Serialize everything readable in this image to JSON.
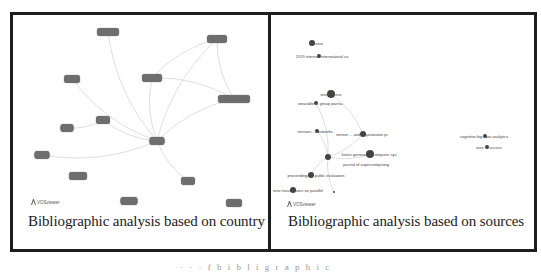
{
  "figure": {
    "panels": [
      {
        "caption": "Bibliographic analysis based on country",
        "watermark": "VOSviewer",
        "nodes": [
          {
            "x": 108,
            "y": 32,
            "w": 22,
            "label": "country"
          },
          {
            "x": 217,
            "y": 39,
            "w": 20,
            "label": "country"
          },
          {
            "x": 72,
            "y": 79,
            "w": 16,
            "label": "country"
          },
          {
            "x": 152,
            "y": 78,
            "w": 20,
            "label": "country"
          },
          {
            "x": 234,
            "y": 99,
            "w": 32,
            "label": "country"
          },
          {
            "x": 103,
            "y": 120,
            "w": 14,
            "label": "country"
          },
          {
            "x": 67,
            "y": 128,
            "w": 13,
            "label": "country"
          },
          {
            "x": 157,
            "y": 141,
            "w": 15,
            "label": "country"
          },
          {
            "x": 42,
            "y": 155,
            "w": 15,
            "label": "country"
          },
          {
            "x": 78,
            "y": 176,
            "w": 18,
            "label": "country"
          },
          {
            "x": 188,
            "y": 181,
            "w": 14,
            "label": "country"
          },
          {
            "x": 129,
            "y": 201,
            "w": 17,
            "label": "country"
          },
          {
            "x": 234,
            "y": 203,
            "w": 16,
            "label": "country"
          }
        ],
        "edges": [
          [
            0,
            7
          ],
          [
            1,
            3
          ],
          [
            1,
            7
          ],
          [
            4,
            7
          ],
          [
            3,
            7
          ],
          [
            5,
            7
          ],
          [
            6,
            5
          ],
          [
            8,
            7
          ],
          [
            7,
            10
          ],
          [
            2,
            7
          ],
          [
            1,
            4
          ],
          [
            4,
            3
          ]
        ]
      },
      {
        "caption": "Bibliographic analysis based on sources",
        "watermark": "VOSviewer",
        "sources": [
          {
            "x": 316,
            "y": 43,
            "label": "sensors"
          },
          {
            "x": 322,
            "y": 56,
            "label": "2019 internati international co"
          },
          {
            "x": 331,
            "y": 94,
            "label": "ieee access"
          },
          {
            "x": 320,
            "y": 103,
            "label": "wearable ... group journa"
          },
          {
            "x": 315,
            "y": 131,
            "label": "sensors ... networks"
          },
          {
            "x": 362,
            "y": 134,
            "label": "sensor ... and organization pr"
          },
          {
            "x": 369,
            "y": 154,
            "label": "future generation computer sys"
          },
          {
            "x": 366,
            "y": 164,
            "label": "journal of supercomputing"
          },
          {
            "x": 316,
            "y": 175,
            "label": "proceedings ... public evaluation"
          },
          {
            "x": 298,
            "y": 190,
            "label": "ieee transactions on parallel"
          },
          {
            "x": 484,
            "y": 136,
            "label": "cognitive big data analytics"
          },
          {
            "x": 489,
            "y": 147,
            "label": "ieee ... access"
          }
        ],
        "dots": [
          {
            "x": 312,
            "y": 43,
            "r": 3
          },
          {
            "x": 319,
            "y": 56,
            "r": 2
          },
          {
            "x": 331,
            "y": 94,
            "r": 4
          },
          {
            "x": 316,
            "y": 103,
            "r": 2
          },
          {
            "x": 317,
            "y": 131,
            "r": 2
          },
          {
            "x": 363,
            "y": 134,
            "r": 3
          },
          {
            "x": 328,
            "y": 157,
            "r": 3
          },
          {
            "x": 370,
            "y": 154,
            "r": 4
          },
          {
            "x": 311,
            "y": 175,
            "r": 3
          },
          {
            "x": 293,
            "y": 190,
            "r": 3
          },
          {
            "x": 485,
            "y": 136,
            "r": 2
          },
          {
            "x": 487,
            "y": 147,
            "r": 2
          },
          {
            "x": 334,
            "y": 192,
            "r": 1
          }
        ],
        "edges": [
          [
            6,
            5
          ],
          [
            6,
            4
          ],
          [
            6,
            3
          ],
          [
            6,
            8
          ],
          [
            6,
            12
          ],
          [
            5,
            2
          ],
          [
            6,
            7
          ]
        ]
      }
    ],
    "bottom_caption_fragment": "· · ·  f  b i b l i  g r a p h i c"
  }
}
